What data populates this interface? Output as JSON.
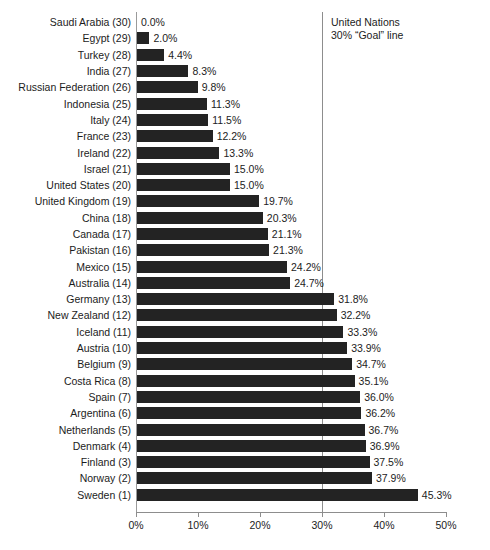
{
  "chart_data": {
    "type": "bar",
    "orientation": "horizontal",
    "title": "",
    "xlabel": "",
    "ylabel": "",
    "xlim": [
      0,
      50
    ],
    "grid": false,
    "legend": null,
    "tick_labels": [
      "0%",
      "10%",
      "20%",
      "30%",
      "40%",
      "50%"
    ],
    "tick_values": [
      0,
      10,
      20,
      30,
      40,
      50
    ],
    "categories": [
      "Saudi Arabia (30)",
      "Egypt (29)",
      "Turkey (28)",
      "India (27)",
      "Russian Federation (26)",
      "Indonesia (25)",
      "Italy (24)",
      "France (23)",
      "Ireland (22)",
      "Israel (21)",
      "United States (20)",
      "United Kingdom (19)",
      "China (18)",
      "Canada (17)",
      "Pakistan (16)",
      "Mexico (15)",
      "Australia (14)",
      "Germany (13)",
      "New Zealand (12)",
      "Iceland (11)",
      "Austria (10)",
      "Belgium (9)",
      "Costa Rica (8)",
      "Spain (7)",
      "Argentina (6)",
      "Netherlands (5)",
      "Denmark (4)",
      "Finland (3)",
      "Norway (2)",
      "Sweden (1)"
    ],
    "values": [
      0.0,
      2.0,
      4.4,
      8.3,
      9.8,
      11.3,
      11.5,
      12.2,
      13.3,
      15.0,
      15.0,
      19.7,
      20.3,
      21.1,
      21.3,
      24.2,
      24.7,
      31.8,
      32.2,
      33.3,
      33.9,
      34.7,
      35.1,
      36.0,
      36.2,
      36.7,
      36.9,
      37.5,
      37.9,
      45.3
    ],
    "value_labels": [
      "0.0%",
      "2.0%",
      "4.4%",
      "8.3%",
      "9.8%",
      "11.3%",
      "11.5%",
      "12.2%",
      "13.3%",
      "15.0%",
      "15.0%",
      "19.7%",
      "20.3%",
      "21.1%",
      "21.3%",
      "24.2%",
      "24.7%",
      "31.8%",
      "32.2%",
      "33.3%",
      "33.9%",
      "34.7%",
      "35.1%",
      "36.0%",
      "36.2%",
      "36.7%",
      "36.9%",
      "37.5%",
      "37.9%",
      "45.3%"
    ],
    "bar_color": "#232323",
    "reference_line": {
      "value": 30,
      "color": "#8d8d8d",
      "label_line1": "United Nations",
      "label_line2": "30% “Goal” line"
    }
  }
}
